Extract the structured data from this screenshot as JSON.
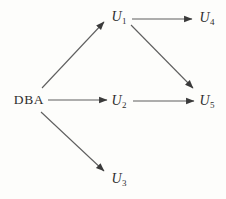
{
  "diagram": {
    "nodes": [
      {
        "id": "DBA",
        "label": "DBA",
        "sub": "",
        "x": 29,
        "y": 100,
        "italic": false
      },
      {
        "id": "U1",
        "label": "U",
        "sub": "1",
        "x": 119,
        "y": 17,
        "italic": true
      },
      {
        "id": "U2",
        "label": "U",
        "sub": "2",
        "x": 119,
        "y": 101,
        "italic": true
      },
      {
        "id": "U3",
        "label": "U",
        "sub": "3",
        "x": 119,
        "y": 179,
        "italic": true
      },
      {
        "id": "U4",
        "label": "U",
        "sub": "4",
        "x": 207,
        "y": 18,
        "italic": true
      },
      {
        "id": "U5",
        "label": "U",
        "sub": "5",
        "x": 207,
        "y": 101,
        "italic": true
      }
    ],
    "edges": [
      {
        "from": "DBA",
        "to": "U1",
        "x1": 42,
        "y1": 88,
        "x2": 104,
        "y2": 22
      },
      {
        "from": "DBA",
        "to": "U2",
        "x1": 48,
        "y1": 100,
        "x2": 107,
        "y2": 100
      },
      {
        "from": "DBA",
        "to": "U3",
        "x1": 41,
        "y1": 112,
        "x2": 104,
        "y2": 171
      },
      {
        "from": "U1",
        "to": "U4",
        "x1": 132,
        "y1": 19,
        "x2": 192,
        "y2": 19
      },
      {
        "from": "U1",
        "to": "U5",
        "x1": 131,
        "y1": 25,
        "x2": 193,
        "y2": 88
      },
      {
        "from": "U2",
        "to": "U5",
        "x1": 133,
        "y1": 101,
        "x2": 194,
        "y2": 101
      }
    ]
  },
  "colors": {
    "background": "#fdfdfb",
    "line": "#5f5f5f",
    "arrowhead": "#3a3a3a",
    "text": "#2e2e2e"
  }
}
